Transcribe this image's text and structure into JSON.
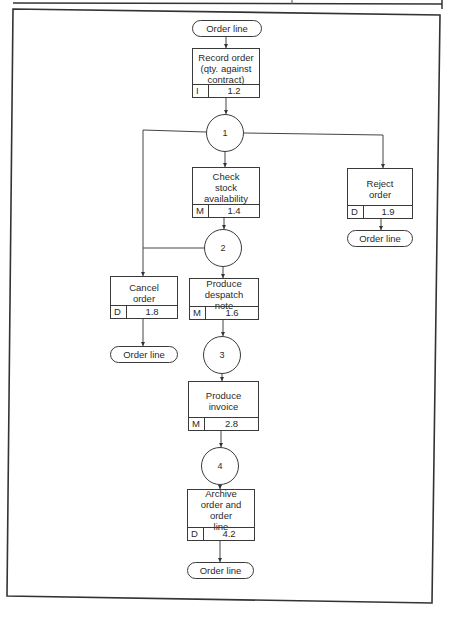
{
  "diagram": {
    "terminators": {
      "start": "Order line",
      "reject_end": "Order line",
      "cancel_end": "Order line",
      "final_end": "Order line"
    },
    "processes": [
      {
        "id": "record",
        "title": "Record order\n(qty. against\ncontract)",
        "code": "I",
        "number": "1.2"
      },
      {
        "id": "check",
        "title": "Check\nstock\navailability",
        "code": "M",
        "number": "1.4"
      },
      {
        "id": "reject",
        "title": "Reject\norder",
        "code": "D",
        "number": "1.9"
      },
      {
        "id": "cancel",
        "title": "Cancel\norder",
        "code": "D",
        "number": "1.8"
      },
      {
        "id": "despatch",
        "title": "Produce\ndespatch\nnote",
        "code": "M",
        "number": "1.6"
      },
      {
        "id": "invoice",
        "title": "Produce\ninvoice",
        "code": "M",
        "number": "2.8"
      },
      {
        "id": "archive",
        "title": "Archive\norder and order\nline",
        "code": "D",
        "number": "4.2"
      }
    ],
    "states": [
      "1",
      "2",
      "3",
      "4"
    ]
  }
}
